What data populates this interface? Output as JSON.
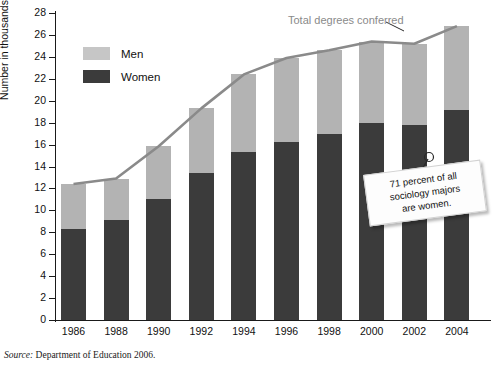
{
  "figure": {
    "source_prefix": "Source:",
    "source_text": "Department of Education 2006."
  },
  "legend": {
    "position": "inside-top-left",
    "items": [
      {
        "label": "Men",
        "color": "#c6c6c6"
      },
      {
        "label": "Women",
        "color": "#3b3b3b"
      }
    ]
  },
  "annotations": {
    "trend_label": "Total degrees conferred",
    "callout_line1": "71 percent of all",
    "callout_line2": "sociology majors",
    "callout_line3": "are women."
  },
  "chart_data": {
    "type": "bar",
    "subtype": "stacked-bar-with-line-overlay",
    "title": "",
    "xlabel": "",
    "ylabel": "Number in thousands",
    "ylim": [
      0,
      28
    ],
    "ytick_step": 2,
    "yticks": [
      0,
      2,
      4,
      6,
      8,
      10,
      12,
      14,
      16,
      18,
      20,
      22,
      24,
      26,
      28
    ],
    "ytick_labels": [
      "0",
      "2",
      "4",
      "6",
      "8",
      "10",
      "12",
      "14",
      "16",
      "18",
      "20",
      "22",
      "24",
      "26",
      "28"
    ],
    "grid": false,
    "categories": [
      "1986",
      "1988",
      "1990",
      "1992",
      "1994",
      "1996",
      "1998",
      "2000",
      "2002",
      "2004"
    ],
    "series": [
      {
        "name": "Women",
        "color": "#3b3b3b",
        "values": [
          8.3,
          9.1,
          11.0,
          13.4,
          15.3,
          16.2,
          17.0,
          18.0,
          17.8,
          19.2
        ]
      },
      {
        "name": "Men",
        "color": "#b3b3b3",
        "values": [
          4.1,
          3.8,
          4.85,
          5.9,
          7.1,
          7.7,
          7.6,
          7.4,
          7.4,
          7.6
        ]
      }
    ],
    "overlay_line": {
      "name": "Total degrees conferred",
      "color": "#8a8a8a",
      "values": [
        12.4,
        12.9,
        15.85,
        19.3,
        22.4,
        23.9,
        24.6,
        25.4,
        25.2,
        26.8
      ]
    }
  }
}
